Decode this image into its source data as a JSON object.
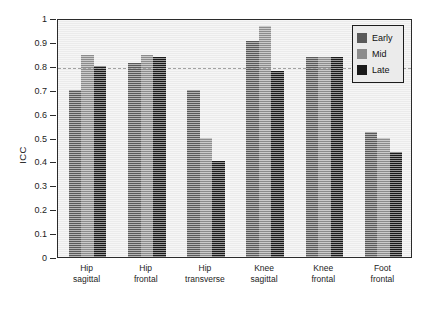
{
  "chart_data": {
    "type": "bar",
    "title": "",
    "subtitle": "",
    "xlabel": "",
    "ylabel": "ICC",
    "ylim": [
      0,
      1
    ],
    "xlim": [
      0,
      6
    ],
    "grid": false,
    "legend_position": "top-right",
    "categories": [
      "Hip sagittal",
      "Hip frontal",
      "Hip transverse",
      "Knee sagittal",
      "Knee frontal",
      "Foot frontal"
    ],
    "category_lines": [
      [
        "Hip",
        "sagittal"
      ],
      [
        "Hip",
        "frontal"
      ],
      [
        "Hip",
        "transverse"
      ],
      [
        "Knee",
        "sagittal"
      ],
      [
        "Knee",
        "frontal"
      ],
      [
        "Foot",
        "frontal"
      ]
    ],
    "series": [
      {
        "name": "Early",
        "color": "#595959",
        "values": [
          0.7,
          0.81,
          0.7,
          0.905,
          0.835,
          0.525
        ]
      },
      {
        "name": "Mid",
        "color": "#8c8c8c",
        "values": [
          0.845,
          0.845,
          0.5,
          0.965,
          0.835,
          0.5
        ]
      },
      {
        "name": "Late",
        "color": "#1a1a1a",
        "values": [
          0.8,
          0.838,
          0.4,
          0.78,
          0.835,
          0.44
        ]
      }
    ],
    "y_ticks": [
      0,
      0.1,
      0.2,
      0.3,
      0.4,
      0.5,
      0.6,
      0.7,
      0.8,
      0.9,
      1
    ],
    "y_tick_labels": [
      "0",
      "0.1",
      "0.2",
      "0.3",
      "0.4",
      "0.5",
      "0.6",
      "0.7",
      "0.8",
      "0.9",
      "1"
    ],
    "annotations": [
      {
        "type": "hline",
        "name": "icc-threshold-line",
        "value": 0.8,
        "style": "dashed",
        "color": "#333333"
      }
    ],
    "plot_background": "#ebebeb",
    "axis_color": "#2b2b2b"
  },
  "legend": {
    "entries": [
      {
        "label": "Early",
        "color": "#595959"
      },
      {
        "label": "Mid",
        "color": "#8c8c8c"
      },
      {
        "label": "Late",
        "color": "#1a1a1a"
      }
    ]
  }
}
